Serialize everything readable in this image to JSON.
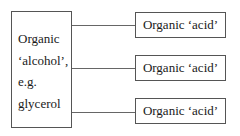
{
  "diagram": {
    "type": "one-to-many",
    "source": {
      "lines": [
        "Organic",
        "‘alcohol’,",
        "e.g.",
        "glycerol"
      ]
    },
    "targets": [
      {
        "label": "Organic ‘acid’"
      },
      {
        "label": "Organic ‘acid’"
      },
      {
        "label": "Organic ‘acid’"
      }
    ],
    "colors": {
      "border": "#555555",
      "connector": "#666666",
      "text": "#1a1a1a",
      "background": "#ffffff"
    }
  }
}
